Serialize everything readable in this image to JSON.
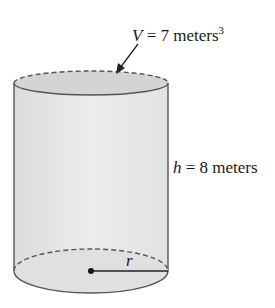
{
  "diagram": {
    "shape": "cylinder",
    "volume_label": {
      "var": "V",
      "eq": " = 7 meters",
      "sup": "3"
    },
    "height_label": {
      "var": "h",
      "eq": " = 8 meters"
    },
    "radius_label": "r",
    "colors": {
      "fill": "#e4e4e4",
      "top_fill": "#d4d4d4",
      "stroke": "#555555",
      "text": "#1a1a1a"
    }
  }
}
